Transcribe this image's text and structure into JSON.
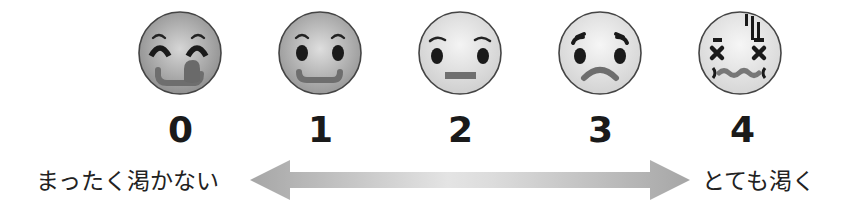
{
  "scale": {
    "title": "",
    "levels": [
      {
        "value": "0",
        "face": "face-delighted-tongue-icon",
        "shade": "#8f8f8f"
      },
      {
        "value": "1",
        "face": "face-smiling-icon",
        "shade": "#9a9a9a"
      },
      {
        "value": "2",
        "face": "face-neutral-icon",
        "shade": "#d2d2d2"
      },
      {
        "value": "3",
        "face": "face-worried-frown-icon",
        "shade": "#dcdcdc"
      },
      {
        "value": "4",
        "face": "face-dizzy-exhausted-icon",
        "shade": "#e0e0e0"
      }
    ],
    "left_label": "まったく渇かない",
    "right_label": "とても渇く",
    "arrow": {
      "direction": "bidirectional",
      "color": "#a6a6a6",
      "center_color": "#e6e6e6"
    }
  }
}
